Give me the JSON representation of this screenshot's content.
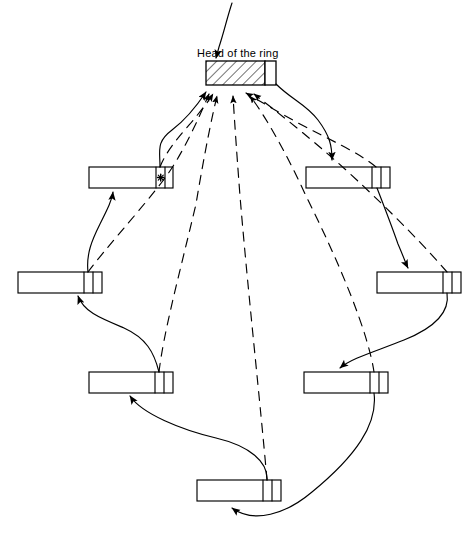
{
  "figure": {
    "type": "diagram",
    "subtype": "circular-linked-list",
    "title": "Head of the ring",
    "background_color": "#ffffff",
    "stroke_color": "#000000",
    "width": 468,
    "height": 551
  },
  "annotations": {
    "head_label": "Head of the ring"
  },
  "head_block": {
    "name": "head-of-the-ring",
    "fill": "hatched",
    "x": 206,
    "y": 61,
    "w": 70,
    "h": 24,
    "pointer_cell_w": 11
  },
  "nodes": [
    {
      "id": "node-1",
      "x": 89,
      "y": 167,
      "w": 84,
      "h": 21,
      "cells": 1,
      "marker": "asterisk"
    },
    {
      "id": "node-2",
      "x": 306,
      "y": 167,
      "w": 84,
      "h": 21,
      "cells": 2,
      "marker": "none"
    },
    {
      "id": "node-3",
      "x": 18,
      "y": 272,
      "w": 84,
      "h": 21,
      "cells": 2,
      "marker": "none"
    },
    {
      "id": "node-4",
      "x": 377,
      "y": 272,
      "w": 84,
      "h": 21,
      "cells": 2,
      "marker": "none"
    },
    {
      "id": "node-5",
      "x": 89,
      "y": 372,
      "w": 84,
      "h": 21,
      "cells": 2,
      "marker": "none"
    },
    {
      "id": "node-6",
      "x": 304,
      "y": 372,
      "w": 84,
      "h": 21,
      "cells": 2,
      "marker": "none"
    },
    {
      "id": "node-7",
      "x": 197,
      "y": 480,
      "w": 84,
      "h": 21,
      "cells": 2,
      "marker": "none"
    }
  ],
  "edges": {
    "solid_description": "successor links forming the ring",
    "dashed_description": "back-pointers from every node to the head of the ring",
    "solid_count": 7,
    "dashed_count": 7
  },
  "leader_line": {
    "name": "head-label-leader",
    "description": "curve from top of figure down to the head block"
  }
}
